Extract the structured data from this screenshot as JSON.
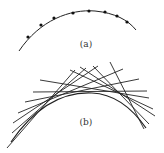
{
  "figure": {
    "panel_a": {
      "label": "(a)",
      "curve_path": "M19,51 C40,20 70,9 95,11 C115,13 128,20 136,30",
      "points": [
        [
          28,
          37
        ],
        [
          41,
          25
        ],
        [
          54,
          18
        ],
        [
          73,
          13
        ],
        [
          89,
          11
        ],
        [
          105,
          12
        ],
        [
          117,
          16
        ],
        [
          127,
          22
        ]
      ]
    },
    "panel_b": {
      "label": "(b)",
      "envelope_path": "M11,142 C40,100 70,92 92,93 C115,94 132,108 146,128",
      "tangent_lines": [
        [
          7,
          148,
          75,
          70
        ],
        [
          12,
          133,
          86,
          68
        ],
        [
          13,
          123,
          98,
          66
        ],
        [
          18,
          113,
          123,
          69
        ],
        [
          25,
          102,
          139,
          79
        ],
        [
          33,
          92,
          147,
          91
        ],
        [
          40,
          80,
          149,
          98
        ],
        [
          70,
          70,
          153,
          109
        ],
        [
          80,
          67,
          155,
          116
        ],
        [
          93,
          66,
          149,
          124
        ],
        [
          110,
          62,
          144,
          129
        ]
      ]
    },
    "colors": {
      "stroke": "#222222",
      "dot": "#111111",
      "label": "#333333"
    }
  }
}
